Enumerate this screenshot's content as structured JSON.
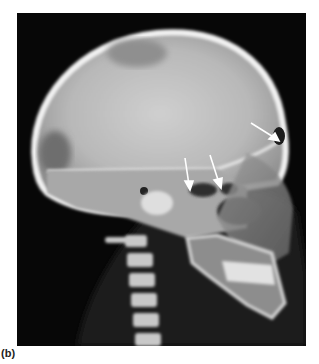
{
  "figure": {
    "label": "(b)",
    "image_description": "Lateral skull X-ray radiograph with three white arrows",
    "arrows": [
      {
        "name": "arrow-1",
        "color": "#ffffff"
      },
      {
        "name": "arrow-2",
        "color": "#ffffff"
      },
      {
        "name": "arrow-3",
        "color": "#ffffff"
      }
    ],
    "colors": {
      "background": "#070707",
      "bone_bright": "#e8e8e8",
      "bone_mid": "#bdbdbd",
      "soft_tissue": "#3a3a3a"
    }
  }
}
